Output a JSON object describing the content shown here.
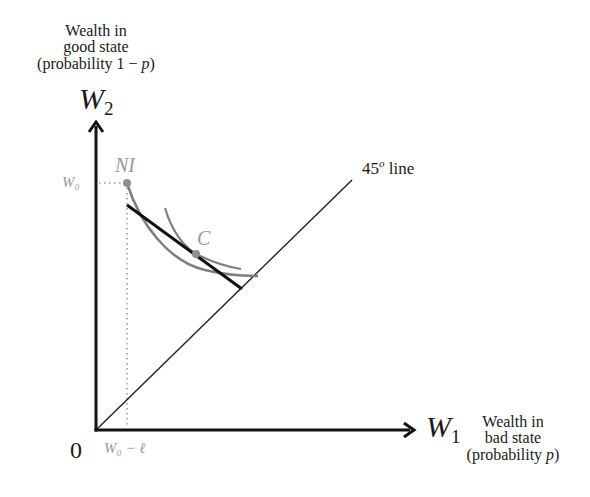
{
  "diagram": {
    "y_axis": {
      "symbol": "W",
      "subscript": "2",
      "description_lines": [
        "Wealth in",
        "good state",
        "(probability 1 − p)"
      ]
    },
    "x_axis": {
      "symbol": "W",
      "subscript": "1",
      "description_lines": [
        "Wealth in",
        "bad state",
        "(probability p)"
      ]
    },
    "origin_label": "0",
    "ticks": {
      "y_tick_label": "W₀",
      "x_tick_label": "W₀ − ℓ"
    },
    "points": {
      "no_insurance_label": "NI",
      "choice_label": "C"
    },
    "line_label": {
      "value": "45",
      "superscript": "o",
      "suffix": " line"
    },
    "colors": {
      "axis": "#111111",
      "budget_line": "#111111",
      "curves": "#7f7f7f",
      "point_labels": "#8f8f8f",
      "guide_dots": "#9a9a9a",
      "diagonal": "#222222"
    }
  }
}
